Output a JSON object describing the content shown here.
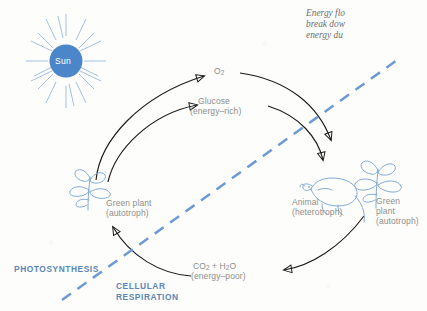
{
  "diagram": {
    "type": "cycle-diagram",
    "title_caption": {
      "line1": "Energy flo",
      "line2": "break dow",
      "line3": "energy du",
      "note": "right-edge-truncated italic caption"
    },
    "sun": {
      "label": "Sun",
      "color": "#4a86c8",
      "ray_count": 20
    },
    "nodes": [
      {
        "id": "plant-left",
        "label_line1": "Green plant",
        "label_line2": "(autotroph)"
      },
      {
        "id": "animal",
        "label_line1": "Animal",
        "label_line2": "(heterotroph)"
      },
      {
        "id": "plant-right",
        "label_line1": "Green",
        "label_line2": "plant",
        "label_line3": "(autotroph)"
      }
    ],
    "flow_labels": [
      {
        "id": "oxygen",
        "line1": "O",
        "sub1": "2",
        "line2": ""
      },
      {
        "id": "glucose",
        "line1": "Glucose",
        "line2": "(energy–rich)"
      },
      {
        "id": "co2h2o",
        "line1": "CO",
        "sub1": "2",
        "mid": " + H",
        "sub2": "2",
        "tail": "O",
        "line2": "(energy–poor)"
      }
    ],
    "zones": [
      {
        "id": "photosynthesis",
        "label": "PHOTOSYNTHESIS"
      },
      {
        "id": "cellular-respiration",
        "label_line1": "CELLULAR",
        "label_line2": "RESPIRATION"
      }
    ],
    "divider": {
      "style": "dashed",
      "color": "#6d9ad4",
      "orientation": "diagonal"
    },
    "colors": {
      "ink": "#1a1a1a",
      "organism_blue": "#7aa7d4",
      "zone_blue": "#5b85b8",
      "label_gray": "#8d8d8d",
      "paper": "#fdfdfb"
    }
  }
}
